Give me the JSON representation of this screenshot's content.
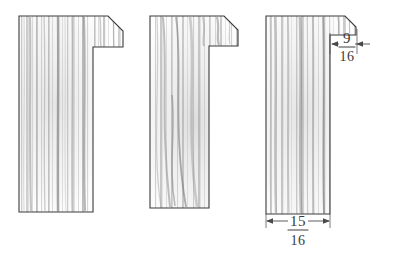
{
  "drawing": {
    "title": "Wood molding cross-section profiles",
    "medium": "pencil sketch",
    "background_color": "#ffffff",
    "ink_color": "#3a3a3a",
    "profile_count": 3
  },
  "profiles": [
    {
      "id": "profile-left",
      "name": "left-molding-profile",
      "description": "L-shaped rabbeted molding with chamfered top-right corner",
      "has_dimensions": false
    },
    {
      "id": "profile-middle",
      "name": "middle-molding-profile",
      "description": "L-shaped rabbeted molding with chamfered top-right corner",
      "has_dimensions": false
    },
    {
      "id": "profile-right",
      "name": "right-molding-profile",
      "description": "Rabbeted molding with small chamfered tab at top-right, dimensioned",
      "has_dimensions": true
    }
  ],
  "dimensions": [
    {
      "id": "dim-rabbet-width",
      "name": "rabbet-width-dimension",
      "numerator": "9",
      "denominator": "16",
      "value_text": "9/16",
      "unit": "inch",
      "orientation": "horizontal",
      "location": "top-right of right profile"
    },
    {
      "id": "dim-overall-width",
      "name": "overall-width-dimension",
      "numerator": "15",
      "denominator": "16",
      "value_text": "15/16",
      "unit": "inch",
      "orientation": "horizontal",
      "location": "below right profile"
    }
  ]
}
